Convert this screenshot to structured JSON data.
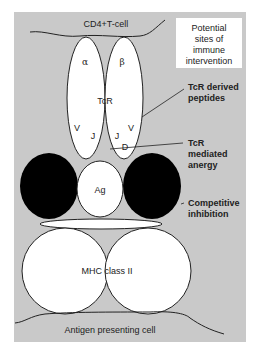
{
  "figure": {
    "background_color": "#c9c9c9",
    "legend_box": {
      "lines": [
        "Potential",
        "sites of",
        "immune",
        "intervention"
      ]
    },
    "cells": {
      "top": "CD4+T-cell",
      "bottom": "Antigen presenting cell"
    },
    "tcr": {
      "label": "TcR",
      "alpha_chain": "α",
      "beta_chain": "β",
      "alpha_segments": [
        "V",
        "J"
      ],
      "beta_segments": [
        "J",
        "V",
        "D"
      ]
    },
    "antigen": {
      "label": "Ag"
    },
    "mhc": {
      "label": "MHC class II"
    },
    "interventions": [
      {
        "lines": [
          "TcR derived",
          "peptides"
        ]
      },
      {
        "lines": [
          "TcR",
          "mediated",
          "anergy"
        ]
      },
      {
        "lines": [
          "Competitive",
          "inhibition"
        ]
      }
    ]
  }
}
